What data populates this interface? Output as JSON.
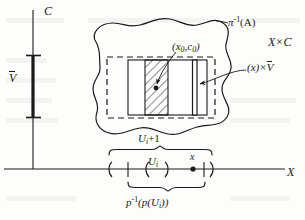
{
  "figure": {
    "width": 305,
    "height": 220,
    "ink_color": "#1a1a1a",
    "background": "#fdfdfc"
  },
  "axes": {
    "vertical_label": "C",
    "horizontal_label": "X",
    "vertical_axis": {
      "x": 33,
      "y_top": 10,
      "y_bottom": 169
    },
    "horizontal_axis": {
      "y": 169,
      "x_left": 4,
      "x_right": 285
    }
  },
  "fiber_segment": {
    "label": "V",
    "label_overline": true,
    "x": 33,
    "y_top": 55,
    "y_bottom": 118
  },
  "labels": {
    "preimage_a": {
      "base": "π",
      "exponent": "-1",
      "arg": "(A)"
    },
    "product_space": "X×C",
    "base_point": "(x",
    "base_point_sub0": "0",
    "base_point_mid": ",c",
    "base_point_sub1": "0",
    "base_point_end": ")",
    "slice": {
      "prefix": "(x)×",
      "bar": "V"
    },
    "u_i_plus_1": {
      "base": "U",
      "sub": "i",
      "tail": "+1"
    },
    "u_i": {
      "base": "U",
      "sub": "i"
    },
    "point_x": "x",
    "p_inverse_p_ui": {
      "base": "p",
      "exponent": "-1",
      "open": "(p(U",
      "sub": "i",
      "close": "))"
    }
  },
  "blob": {
    "name": "pi-inverse-of-A-region",
    "description": "wavy closed curve enclosing the neighborhood stack"
  },
  "outer_dashed_rect": {
    "x": 107,
    "y": 57,
    "width": 108,
    "height": 61
  },
  "inner_solid_rect": {
    "x": 128,
    "y": 60,
    "width": 79,
    "height": 55
  },
  "hatched_band": {
    "x": 145,
    "y": 60,
    "width": 23,
    "height": 55
  },
  "slice_band": {
    "x": 193,
    "y": 60,
    "width": 4,
    "height": 55
  },
  "dots": [
    {
      "name": "base-point-dot",
      "x": 156,
      "y": 88
    },
    {
      "name": "x-axis-point-dot",
      "x": 193,
      "y": 169
    }
  ],
  "x_axis_marks": {
    "left_paren": 109,
    "tick_left": 128,
    "inner_left_paren": 146,
    "inner_right_paren": 167,
    "tick_right": 204,
    "right_paren": 213
  },
  "braces": [
    {
      "name": "u-i-plus-1-brace",
      "x_start": 109,
      "x_end": 213,
      "y": 150
    },
    {
      "name": "p-inverse-p-u-i-brace",
      "x_start": 128,
      "x_end": 204,
      "y": 188
    }
  ]
}
